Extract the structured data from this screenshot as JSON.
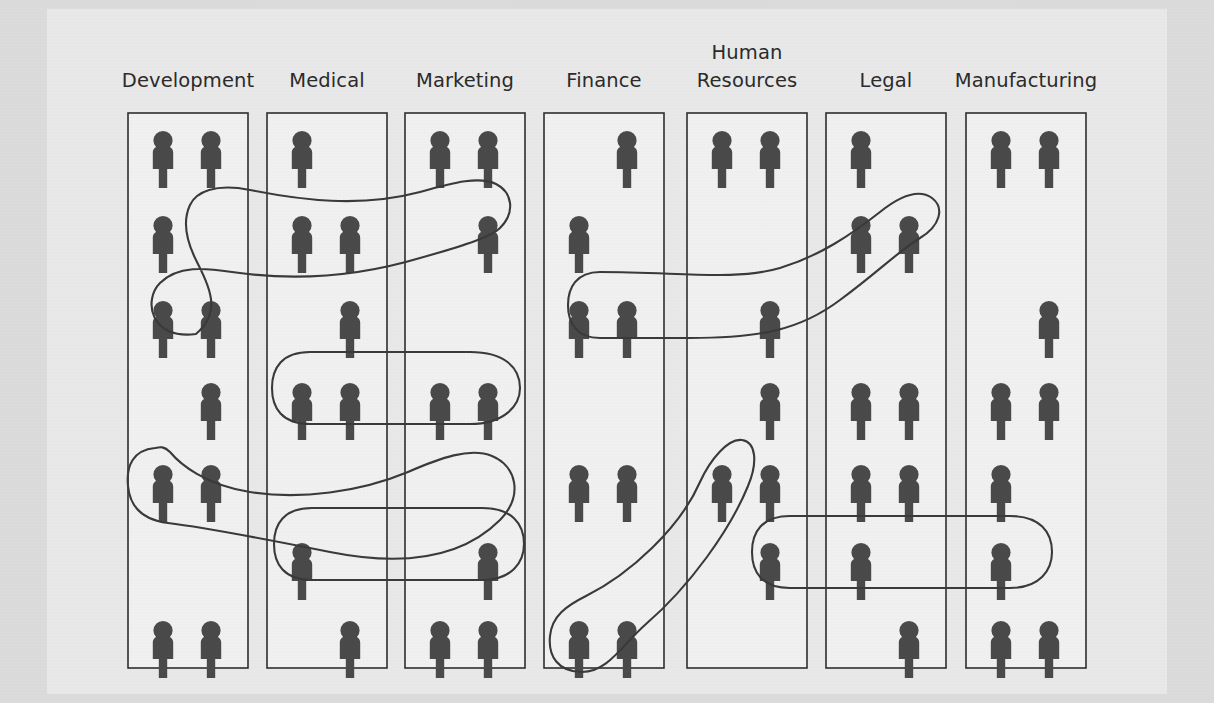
{
  "diagram": {
    "type": "pictogram-network",
    "colors": {
      "page_background": "#ffffff",
      "canvas_background": "#dcdcdc",
      "paper_background": "#e9e9e9",
      "column_fill": "#f1f1f1",
      "column_stroke": "#2f2f2f",
      "person_icon": "#4a4a4a",
      "connector_stroke": "#3a3a3a",
      "label_text": "#2b2b2b"
    },
    "icon_name": "person-icon",
    "rows_per_column": 7,
    "slots_per_row": 2,
    "columns": [
      {
        "id": "development",
        "label": "Development",
        "label_lines": [
          "Development"
        ],
        "total_people": 10,
        "rows": [
          {
            "row": 1,
            "left": true,
            "right": true
          },
          {
            "row": 2,
            "left": true,
            "right": false
          },
          {
            "row": 3,
            "left": true,
            "right": true
          },
          {
            "row": 4,
            "left": false,
            "right": true
          },
          {
            "row": 5,
            "left": true,
            "right": true
          },
          {
            "row": 6,
            "left": false,
            "right": false
          },
          {
            "row": 7,
            "left": true,
            "right": true
          }
        ]
      },
      {
        "id": "medical",
        "label": "Medical",
        "label_lines": [
          "Medical"
        ],
        "total_people": 8,
        "rows": [
          {
            "row": 1,
            "left": true,
            "right": false
          },
          {
            "row": 2,
            "left": true,
            "right": true
          },
          {
            "row": 3,
            "left": false,
            "right": true
          },
          {
            "row": 4,
            "left": true,
            "right": true
          },
          {
            "row": 5,
            "left": false,
            "right": false
          },
          {
            "row": 6,
            "left": true,
            "right": false
          },
          {
            "row": 7,
            "left": false,
            "right": true
          }
        ]
      },
      {
        "id": "marketing",
        "label": "Marketing",
        "label_lines": [
          "Marketing"
        ],
        "total_people": 8,
        "rows": [
          {
            "row": 1,
            "left": true,
            "right": true
          },
          {
            "row": 2,
            "left": false,
            "right": true
          },
          {
            "row": 3,
            "left": false,
            "right": false
          },
          {
            "row": 4,
            "left": true,
            "right": true
          },
          {
            "row": 5,
            "left": false,
            "right": false
          },
          {
            "row": 6,
            "left": false,
            "right": true
          },
          {
            "row": 7,
            "left": true,
            "right": true
          }
        ]
      },
      {
        "id": "finance",
        "label": "Finance",
        "label_lines": [
          "Finance"
        ],
        "total_people": 8,
        "rows": [
          {
            "row": 1,
            "left": false,
            "right": true
          },
          {
            "row": 2,
            "left": true,
            "right": false
          },
          {
            "row": 3,
            "left": true,
            "right": true
          },
          {
            "row": 4,
            "left": false,
            "right": false
          },
          {
            "row": 5,
            "left": true,
            "right": true
          },
          {
            "row": 6,
            "left": false,
            "right": false
          },
          {
            "row": 7,
            "left": true,
            "right": true
          }
        ]
      },
      {
        "id": "human-resources",
        "label": "Human Resources",
        "label_lines": [
          "Human",
          "Resources"
        ],
        "total_people": 7,
        "rows": [
          {
            "row": 1,
            "left": true,
            "right": true
          },
          {
            "row": 2,
            "left": false,
            "right": false
          },
          {
            "row": 3,
            "left": false,
            "right": true
          },
          {
            "row": 4,
            "left": false,
            "right": true
          },
          {
            "row": 5,
            "left": true,
            "right": true
          },
          {
            "row": 6,
            "left": false,
            "right": true
          },
          {
            "row": 7,
            "left": false,
            "right": false
          }
        ]
      },
      {
        "id": "legal",
        "label": "Legal",
        "label_lines": [
          "Legal"
        ],
        "total_people": 9,
        "rows": [
          {
            "row": 1,
            "left": true,
            "right": false
          },
          {
            "row": 2,
            "left": true,
            "right": true
          },
          {
            "row": 3,
            "left": false,
            "right": false
          },
          {
            "row": 4,
            "left": true,
            "right": true
          },
          {
            "row": 5,
            "left": true,
            "right": true
          },
          {
            "row": 6,
            "left": true,
            "right": false
          },
          {
            "row": 7,
            "left": false,
            "right": true
          }
        ]
      },
      {
        "id": "manufacturing",
        "label": "Manufacturing",
        "label_lines": [
          "Manufacturing"
        ],
        "total_people": 9,
        "rows": [
          {
            "row": 1,
            "left": true,
            "right": true
          },
          {
            "row": 2,
            "left": false,
            "right": false
          },
          {
            "row": 3,
            "left": false,
            "right": true
          },
          {
            "row": 4,
            "left": true,
            "right": true
          },
          {
            "row": 5,
            "left": true,
            "right": false
          },
          {
            "row": 6,
            "left": true,
            "right": false
          },
          {
            "row": 7,
            "left": true,
            "right": true
          }
        ]
      }
    ],
    "connectors": [
      {
        "id": "c1",
        "name": "development-r3-to-marketing-r2",
        "links": [
          "development",
          "medical",
          "marketing"
        ]
      },
      {
        "id": "c2",
        "name": "medical-r4-to-marketing-r4",
        "links": [
          "medical",
          "marketing"
        ]
      },
      {
        "id": "c3",
        "name": "finance-r3-to-legal-r2",
        "links": [
          "finance",
          "human-resources",
          "legal"
        ]
      },
      {
        "id": "c4",
        "name": "development-r5-to-marketing-r4-cross",
        "links": [
          "development",
          "marketing"
        ]
      },
      {
        "id": "c5",
        "name": "medical-r6-to-marketing-r6",
        "links": [
          "medical",
          "marketing"
        ]
      },
      {
        "id": "c6",
        "name": "finance-r7-to-hr-r5-diagonal",
        "links": [
          "finance",
          "human-resources"
        ]
      },
      {
        "id": "c7",
        "name": "legal-r6-to-manufacturing-r6-capsule",
        "links": [
          "legal",
          "manufacturing"
        ]
      }
    ]
  }
}
